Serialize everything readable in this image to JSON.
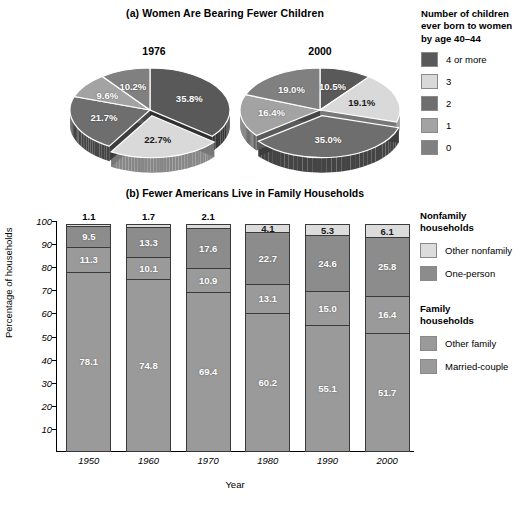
{
  "panel_a": {
    "title": "(a) Women Are Bearing Fewer Children",
    "legend": {
      "title_line1": "Number of children",
      "title_line2": "ever born to women",
      "title_line3": "by age 40–44",
      "items": [
        {
          "label": "4 or more",
          "color": "#595959"
        },
        {
          "label": "3",
          "color": "#d9d9d9"
        },
        {
          "label": "2",
          "color": "#6e6e6e"
        },
        {
          "label": "1",
          "color": "#a3a3a3"
        },
        {
          "label": "0",
          "color": "#808080"
        }
      ]
    },
    "pies": [
      {
        "year": "1976",
        "slices": [
          {
            "category": "4 or more",
            "value": 35.8,
            "label": "35.8%",
            "color": "#595959",
            "exploded": false
          },
          {
            "category": "3",
            "value": 22.7,
            "label": "22.7%",
            "color": "#d9d9d9",
            "exploded": true
          },
          {
            "category": "2",
            "value": 21.7,
            "label": "21.7%",
            "color": "#6e6e6e",
            "exploded": false
          },
          {
            "category": "1",
            "value": 9.6,
            "label": "9.6%",
            "color": "#a3a3a3",
            "exploded": false
          },
          {
            "category": "0",
            "value": 10.2,
            "label": "10.2%",
            "color": "#808080",
            "exploded": false
          }
        ]
      },
      {
        "year": "2000",
        "slices": [
          {
            "category": "4 or more",
            "value": 10.5,
            "label": "10.5%",
            "color": "#595959",
            "exploded": false
          },
          {
            "category": "3",
            "value": 19.1,
            "label": "19.1%",
            "color": "#d9d9d9",
            "exploded": false
          },
          {
            "category": "2",
            "value": 35.0,
            "label": "35.0%",
            "color": "#6e6e6e",
            "exploded": true
          },
          {
            "category": "1",
            "value": 16.4,
            "label": "16.4%",
            "color": "#a3a3a3",
            "exploded": false
          },
          {
            "category": "0",
            "value": 19.0,
            "label": "19.0%",
            "color": "#808080",
            "exploded": false
          }
        ]
      }
    ]
  },
  "panel_b": {
    "title": "(b) Fewer Americans Live in Family Households",
    "xlabel": "Year",
    "ylabel": "Percentage of households",
    "yticks": [
      "100",
      "90",
      "80",
      "70",
      "60",
      "50",
      "40",
      "30",
      "20",
      "10"
    ],
    "legend": {
      "group1_line1": "Nonfamily",
      "group1_line2": "households",
      "group2_line1": "Family",
      "group2_line2": "households",
      "items": [
        {
          "label": "Other nonfamily",
          "color": "#dcdcdc"
        },
        {
          "label": "One-person",
          "color": "#8c8c8c"
        },
        {
          "label": "Other family",
          "color": "#9a9a9a"
        },
        {
          "label": "Married-couple",
          "color": "#9a9a9a"
        }
      ]
    }
  },
  "chart_data": [
    {
      "type": "pie",
      "title": "1976",
      "labels": [
        "4 or more",
        "3",
        "2",
        "1",
        "0"
      ],
      "values": [
        35.8,
        22.7,
        21.7,
        9.6,
        10.2
      ],
      "legend_title": "Number of children ever born to women by age 40–44",
      "legend_position": "right",
      "exploded": [
        "3"
      ]
    },
    {
      "type": "pie",
      "title": "2000",
      "labels": [
        "4 or more",
        "3",
        "2",
        "1",
        "0"
      ],
      "values": [
        10.5,
        19.1,
        35.0,
        16.4,
        19.0
      ],
      "legend_title": "Number of children ever born to women by age 40–44",
      "legend_position": "right",
      "exploded": [
        "2"
      ]
    },
    {
      "type": "bar",
      "subtype": "stacked",
      "title": "(b) Fewer Americans Live in Family Households",
      "xlabel": "Year",
      "ylabel": "Percentage of households",
      "ylim": [
        0,
        100
      ],
      "yticks": [
        10,
        20,
        30,
        40,
        50,
        60,
        70,
        80,
        90,
        100
      ],
      "grid": false,
      "legend_position": "right",
      "categories": [
        "1950",
        "1960",
        "1970",
        "1980",
        "1990",
        "2000"
      ],
      "series": [
        {
          "name": "Married-couple",
          "values": [
            78.1,
            74.8,
            69.4,
            60.2,
            55.1,
            51.7
          ],
          "color": "#9a9a9a"
        },
        {
          "name": "Other family",
          "values": [
            11.3,
            10.1,
            10.9,
            13.1,
            15.0,
            16.4
          ],
          "color": "#9a9a9a"
        },
        {
          "name": "One-person",
          "values": [
            9.5,
            13.3,
            17.6,
            22.7,
            24.6,
            25.8
          ],
          "color": "#8c8c8c"
        },
        {
          "name": "Other nonfamily",
          "values": [
            1.1,
            1.7,
            2.1,
            4.1,
            5.3,
            6.1
          ],
          "color": "#dcdcdc"
        }
      ]
    }
  ]
}
